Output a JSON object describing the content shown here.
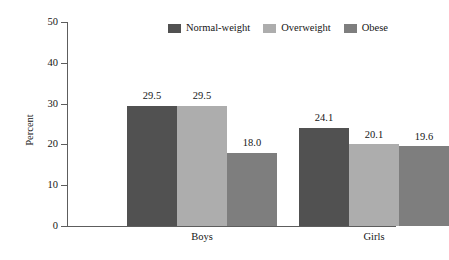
{
  "chart_data": {
    "type": "bar",
    "title": "",
    "subtitle": "",
    "xlabel": "",
    "ylabel": "Percent",
    "categories": [
      "Boys",
      "Girls"
    ],
    "series": [
      {
        "name": "Normal-weight",
        "values": [
          29.5,
          24.1
        ],
        "color": "#515151"
      },
      {
        "name": "Overweight",
        "values": [
          29.5,
          20.1
        ],
        "color": "#adadad"
      },
      {
        "name": "Obese",
        "values": [
          18.0,
          19.6
        ],
        "color": "#7e7e7e"
      }
    ],
    "value_labels": [
      [
        "29.5",
        "29.5",
        "18.0"
      ],
      [
        "24.1",
        "20.1",
        "19.6"
      ]
    ],
    "ylim": [
      0,
      50
    ],
    "yticks": [
      0,
      10,
      20,
      30,
      40,
      50
    ],
    "ytick_labels": [
      "0",
      "10",
      "20",
      "30",
      "40",
      "50"
    ],
    "grid": false,
    "legend_position": "top-right",
    "bar_gap_within_group": 0,
    "axis_color": "#5d5d5d",
    "background": "#ffffff"
  }
}
